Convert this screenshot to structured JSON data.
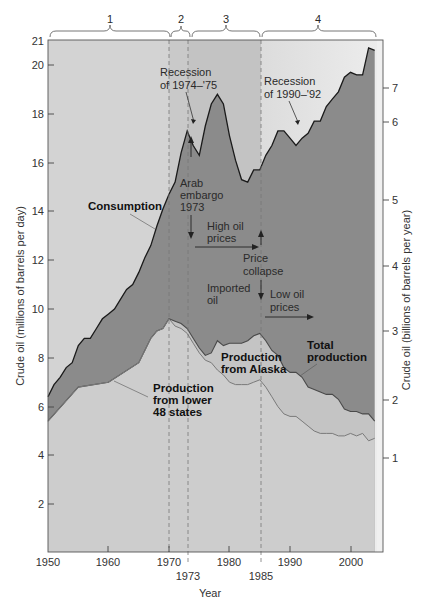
{
  "chart_data": {
    "type": "area",
    "title": "",
    "xlabel": "Year",
    "ylabel": "Crude oil (millions of barrels per day)",
    "ylabel_right": "Crude oil (billions of barrels per year)",
    "xlim": [
      1950,
      2005
    ],
    "ylim": [
      0,
      21
    ],
    "ylim_right": [
      0,
      7.7
    ],
    "x_ticks": [
      1950,
      1960,
      1970,
      1980,
      1990,
      2000
    ],
    "x_ticks_extra": [
      1973,
      1985
    ],
    "y_ticks": [
      2,
      4,
      6,
      8,
      10,
      12,
      14,
      16,
      18,
      20,
      21
    ],
    "y_ticks_right": [
      1,
      2,
      3,
      4,
      5,
      6,
      7
    ],
    "grid": false,
    "legend": "inline annotations",
    "periods": [
      {
        "label": "1",
        "start": 1950,
        "end": 1970,
        "color": "#d3d3d3"
      },
      {
        "label": "2",
        "start": 1970,
        "end": 1973,
        "color": "#c9c9c9"
      },
      {
        "label": "3",
        "start": 1973,
        "end": 1985,
        "color": "#c3c3c3"
      },
      {
        "label": "4",
        "start": 1985,
        "end": 2004,
        "color": "#e0e0e0"
      }
    ],
    "series": [
      {
        "name": "Consumption",
        "color": "#8a8a8a",
        "points": [
          [
            1950,
            6.4
          ],
          [
            1951,
            6.9
          ],
          [
            1952,
            7.2
          ],
          [
            1953,
            7.6
          ],
          [
            1954,
            7.8
          ],
          [
            1955,
            8.5
          ],
          [
            1956,
            8.8
          ],
          [
            1957,
            8.8
          ],
          [
            1958,
            9.2
          ],
          [
            1959,
            9.6
          ],
          [
            1960,
            9.8
          ],
          [
            1961,
            10.0
          ],
          [
            1962,
            10.4
          ],
          [
            1963,
            10.8
          ],
          [
            1964,
            11.0
          ],
          [
            1965,
            11.5
          ],
          [
            1966,
            12.1
          ],
          [
            1967,
            12.6
          ],
          [
            1968,
            13.4
          ],
          [
            1969,
            14.1
          ],
          [
            1970,
            14.7
          ],
          [
            1971,
            15.2
          ],
          [
            1972,
            16.4
          ],
          [
            1973,
            17.3
          ],
          [
            1974,
            16.7
          ],
          [
            1975,
            16.3
          ],
          [
            1976,
            17.5
          ],
          [
            1977,
            18.4
          ],
          [
            1978,
            18.8
          ],
          [
            1979,
            18.4
          ],
          [
            1980,
            17.1
          ],
          [
            1981,
            16.1
          ],
          [
            1982,
            15.3
          ],
          [
            1983,
            15.2
          ],
          [
            1984,
            15.7
          ],
          [
            1985,
            15.7
          ],
          [
            1986,
            16.3
          ],
          [
            1987,
            16.7
          ],
          [
            1988,
            17.3
          ],
          [
            1989,
            17.3
          ],
          [
            1990,
            17.0
          ],
          [
            1991,
            16.7
          ],
          [
            1992,
            17.0
          ],
          [
            1993,
            17.2
          ],
          [
            1994,
            17.7
          ],
          [
            1995,
            17.7
          ],
          [
            1996,
            18.3
          ],
          [
            1997,
            18.6
          ],
          [
            1998,
            18.9
          ],
          [
            1999,
            19.5
          ],
          [
            2000,
            19.7
          ],
          [
            2001,
            19.6
          ],
          [
            2002,
            19.6
          ],
          [
            2003,
            20.7
          ],
          [
            2004,
            20.6
          ]
        ]
      },
      {
        "name": "Total production",
        "color": "#c7c7c7",
        "points": [
          [
            1950,
            5.4
          ],
          [
            1955,
            6.8
          ],
          [
            1960,
            7.0
          ],
          [
            1965,
            7.8
          ],
          [
            1966,
            8.3
          ],
          [
            1967,
            8.8
          ],
          [
            1968,
            9.1
          ],
          [
            1969,
            9.2
          ],
          [
            1970,
            9.6
          ],
          [
            1971,
            9.5
          ],
          [
            1972,
            9.4
          ],
          [
            1973,
            9.2
          ],
          [
            1974,
            8.8
          ],
          [
            1975,
            8.4
          ],
          [
            1976,
            8.1
          ],
          [
            1977,
            8.2
          ],
          [
            1978,
            8.7
          ],
          [
            1979,
            8.5
          ],
          [
            1980,
            8.6
          ],
          [
            1981,
            8.6
          ],
          [
            1982,
            8.6
          ],
          [
            1983,
            8.7
          ],
          [
            1984,
            8.9
          ],
          [
            1985,
            9.0
          ],
          [
            1986,
            8.7
          ],
          [
            1987,
            8.3
          ],
          [
            1988,
            8.1
          ],
          [
            1989,
            7.6
          ],
          [
            1990,
            7.4
          ],
          [
            1991,
            7.4
          ],
          [
            1992,
            7.2
          ],
          [
            1993,
            6.8
          ],
          [
            1994,
            6.7
          ],
          [
            1995,
            6.6
          ],
          [
            1996,
            6.5
          ],
          [
            1997,
            6.5
          ],
          [
            1998,
            6.3
          ],
          [
            1999,
            5.9
          ],
          [
            2000,
            5.8
          ],
          [
            2001,
            5.8
          ],
          [
            2002,
            5.7
          ],
          [
            2003,
            5.7
          ],
          [
            2004,
            5.4
          ]
        ]
      },
      {
        "name": "Production from lower 48 states",
        "color": "#cfcfcf",
        "points": [
          [
            1950,
            5.4
          ],
          [
            1955,
            6.8
          ],
          [
            1960,
            7.0
          ],
          [
            1965,
            7.8
          ],
          [
            1966,
            8.3
          ],
          [
            1967,
            8.8
          ],
          [
            1968,
            9.1
          ],
          [
            1969,
            9.2
          ],
          [
            1970,
            9.6
          ],
          [
            1971,
            9.3
          ],
          [
            1972,
            9.2
          ],
          [
            1973,
            9.0
          ],
          [
            1974,
            8.6
          ],
          [
            1975,
            8.2
          ],
          [
            1976,
            7.9
          ],
          [
            1977,
            7.8
          ],
          [
            1978,
            7.5
          ],
          [
            1979,
            7.3
          ],
          [
            1980,
            7.0
          ],
          [
            1981,
            6.9
          ],
          [
            1982,
            6.9
          ],
          [
            1983,
            6.9
          ],
          [
            1984,
            7.0
          ],
          [
            1985,
            7.1
          ],
          [
            1986,
            6.8
          ],
          [
            1987,
            6.4
          ],
          [
            1988,
            6.0
          ],
          [
            1989,
            5.7
          ],
          [
            1990,
            5.6
          ],
          [
            1991,
            5.6
          ],
          [
            1992,
            5.4
          ],
          [
            1993,
            5.2
          ],
          [
            1994,
            5.0
          ],
          [
            1995,
            4.9
          ],
          [
            1996,
            4.9
          ],
          [
            1997,
            4.9
          ],
          [
            1998,
            4.8
          ],
          [
            1999,
            4.8
          ],
          [
            2000,
            4.9
          ],
          [
            2001,
            4.8
          ],
          [
            2002,
            4.9
          ],
          [
            2003,
            4.6
          ],
          [
            2004,
            4.7
          ]
        ]
      }
    ],
    "annotations": [
      {
        "text": "Recession of 1974–'75",
        "year": 1975
      },
      {
        "text": "Recession of 1990–'92",
        "year": 1991
      },
      {
        "text": "Arab embargo 1973",
        "year": 1973
      },
      {
        "text": "High oil prices",
        "year": 1973
      },
      {
        "text": "Price collapse",
        "year": 1985
      },
      {
        "text": "Low oil prices",
        "year": 1985
      },
      {
        "text": "Imported oil"
      },
      {
        "text": "Consumption"
      },
      {
        "text": "Total production"
      },
      {
        "text": "Production from Alaska"
      },
      {
        "text": "Production from lower 48 states"
      }
    ]
  },
  "labels": {
    "period_1": "1",
    "period_2": "2",
    "period_3": "3",
    "period_4": "4",
    "recession_1974_l1": "Recession",
    "recession_1974_l2": "of 1974–'75",
    "recession_1990_l1": "Recession",
    "recession_1990_l2": "of 1990–'92",
    "arab_l1": "Arab",
    "arab_l2": "embargo",
    "arab_l3": "1973",
    "consumption": "Consumption",
    "high_l1": "High oil",
    "high_l2": "prices",
    "price_l1": "Price",
    "price_l2": "collapse",
    "imported_l1": "Imported",
    "imported_l2": "oil",
    "low_l1": "Low oil",
    "low_l2": "prices",
    "total_l1": "Total",
    "total_l2": "production",
    "alaska_l1": "Production",
    "alaska_l2": "from  Alaska",
    "lower48_l1": "Production",
    "lower48_l2": "from lower",
    "lower48_l3": "48 states",
    "x_title": "Year",
    "y_title_left": "Crude oil (millions of barrels per day)",
    "y_title_right": "Crude oil (billions of barrels per year)",
    "x_1950": "1950",
    "x_1960": "1960",
    "x_1970": "1970",
    "x_1980": "1980",
    "x_1990": "1990",
    "x_2000": "2000",
    "x_1973": "1973",
    "x_1985": "1985",
    "y_2": "2",
    "y_4": "4",
    "y_6": "6",
    "y_8": "8",
    "y_10": "10",
    "y_12": "12",
    "y_14": "14",
    "y_16": "16",
    "y_18": "18",
    "y_20": "20",
    "y_21": "21",
    "r_1": "1",
    "r_2": "2",
    "r_3": "3",
    "r_4": "4",
    "r_5": "5",
    "r_6": "6",
    "r_7": "7"
  }
}
